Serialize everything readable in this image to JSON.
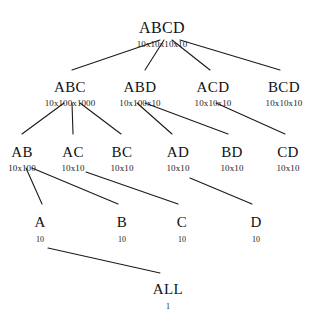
{
  "diagram": {
    "background_color": "#ffffff",
    "line_color": "#1a1a1a",
    "text_color": "#111111",
    "width": 312,
    "height": 312,
    "nodes": [
      {
        "id": "ABCD",
        "label": "ABCD",
        "sublabel": "10x10x10x10",
        "x": 162,
        "y": 20,
        "level": 0
      },
      {
        "id": "ABC",
        "label": "ABC",
        "sublabel": "10x100x1000",
        "x": 70,
        "y": 80,
        "level": 1
      },
      {
        "id": "ABD",
        "label": "ABD",
        "sublabel": "10x100x10",
        "x": 140,
        "y": 80,
        "level": 1
      },
      {
        "id": "ACD",
        "label": "ACD",
        "sublabel": "10x10x10",
        "x": 213,
        "y": 80,
        "level": 1
      },
      {
        "id": "BCD",
        "label": "BCD",
        "sublabel": "10x10x10",
        "x": 284,
        "y": 80,
        "level": 1
      },
      {
        "id": "AB",
        "label": "AB",
        "sublabel": "10x100",
        "x": 22,
        "y": 145,
        "level": 2
      },
      {
        "id": "AC",
        "label": "AC",
        "sublabel": "10x10",
        "x": 73,
        "y": 145,
        "level": 2
      },
      {
        "id": "BC",
        "label": "BC",
        "sublabel": "10x10",
        "x": 122,
        "y": 145,
        "level": 2
      },
      {
        "id": "AD",
        "label": "AD",
        "sublabel": "10x10",
        "x": 178,
        "y": 145,
        "level": 2
      },
      {
        "id": "BD",
        "label": "BD",
        "sublabel": "10x10",
        "x": 232,
        "y": 145,
        "level": 2
      },
      {
        "id": "CD",
        "label": "CD",
        "sublabel": "10x10",
        "x": 288,
        "y": 145,
        "level": 2
      },
      {
        "id": "A",
        "label": "A",
        "sublabel": "10",
        "x": 40,
        "y": 215,
        "level": 3
      },
      {
        "id": "B",
        "label": "B",
        "sublabel": "10",
        "x": 122,
        "y": 215,
        "level": 3
      },
      {
        "id": "C",
        "label": "C",
        "sublabel": "10",
        "x": 182,
        "y": 215,
        "level": 3
      },
      {
        "id": "D",
        "label": "D",
        "sublabel": "10",
        "x": 256,
        "y": 215,
        "level": 3
      },
      {
        "id": "ALL",
        "label": "ALL",
        "sublabel": "1",
        "x": 168,
        "y": 282,
        "level": 4
      }
    ],
    "edges": [
      {
        "from": "ABCD",
        "to": "ABC",
        "x1": 160,
        "y1": 40,
        "x2": 72,
        "y2": 70
      },
      {
        "from": "ABCD",
        "to": "ABD",
        "x1": 164,
        "y1": 40,
        "x2": 145,
        "y2": 70
      },
      {
        "from": "ABCD",
        "to": "ACD",
        "x1": 172,
        "y1": 40,
        "x2": 210,
        "y2": 70
      },
      {
        "from": "ABCD",
        "to": "BCD",
        "x1": 180,
        "y1": 40,
        "x2": 280,
        "y2": 70
      },
      {
        "from": "ABC",
        "to": "AB",
        "x1": 64,
        "y1": 103,
        "x2": 22,
        "y2": 134
      },
      {
        "from": "ABC",
        "to": "AC",
        "x1": 72,
        "y1": 103,
        "x2": 73,
        "y2": 134
      },
      {
        "from": "ABC",
        "to": "BC",
        "x1": 80,
        "y1": 103,
        "x2": 121,
        "y2": 134
      },
      {
        "from": "ABD",
        "to": "AD",
        "x1": 137,
        "y1": 103,
        "x2": 172,
        "y2": 134
      },
      {
        "from": "ABD",
        "to": "BD",
        "x1": 145,
        "y1": 103,
        "x2": 228,
        "y2": 134
      },
      {
        "from": "ACD",
        "to": "CD",
        "x1": 216,
        "y1": 103,
        "x2": 285,
        "y2": 134
      },
      {
        "from": "AB",
        "to": "A",
        "x1": 26,
        "y1": 168,
        "x2": 42,
        "y2": 204
      },
      {
        "from": "AB",
        "to": "B",
        "x1": 32,
        "y1": 168,
        "x2": 118,
        "y2": 204
      },
      {
        "from": "AC",
        "to": "C",
        "x1": 86,
        "y1": 172,
        "x2": 178,
        "y2": 204
      },
      {
        "from": "AD",
        "to": "D",
        "x1": 190,
        "y1": 178,
        "x2": 252,
        "y2": 204
      },
      {
        "from": "A",
        "to": "ALL",
        "x1": 48,
        "y1": 248,
        "x2": 160,
        "y2": 273
      }
    ]
  }
}
